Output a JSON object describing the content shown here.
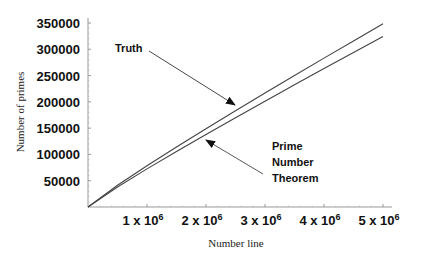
{
  "chart_data": {
    "type": "line",
    "title": "",
    "xlabel": "Number line",
    "ylabel": "Number of primes",
    "xlim": [
      0,
      5000000
    ],
    "ylim": [
      0,
      350000
    ],
    "x_ticks": [
      {
        "value": 1000000,
        "label": "1 x 10",
        "exp": "6"
      },
      {
        "value": 2000000,
        "label": "2 x 10",
        "exp": "6"
      },
      {
        "value": 3000000,
        "label": "3 x 10",
        "exp": "6"
      },
      {
        "value": 4000000,
        "label": "4 x 10",
        "exp": "6"
      },
      {
        "value": 5000000,
        "label": "5 x 10",
        "exp": "6"
      }
    ],
    "y_ticks": [
      {
        "value": 50000,
        "label": "50000"
      },
      {
        "value": 100000,
        "label": "100000"
      },
      {
        "value": 150000,
        "label": "150000"
      },
      {
        "value": 200000,
        "label": "200000"
      },
      {
        "value": 250000,
        "label": "250000"
      },
      {
        "value": 300000,
        "label": "300000"
      },
      {
        "value": 350000,
        "label": "350000"
      }
    ],
    "grid": false,
    "legend": "none (inline annotations)",
    "x": [
      0,
      500000,
      1000000,
      1500000,
      2000000,
      2500000,
      3000000,
      3500000,
      4000000,
      4500000,
      5000000
    ],
    "series": [
      {
        "name": "Truth",
        "values": [
          0,
          41538,
          78498,
          114155,
          148933,
          183072,
          216816,
          250150,
          283146,
          315948,
          348513
        ]
      },
      {
        "name": "Prime Number Theorem",
        "values": [
          0,
          38102,
          72382,
          105477,
          137849,
          169718,
          201211,
          232410,
          263369,
          294127,
          324150
        ]
      }
    ],
    "annotations": [
      {
        "text": "Truth",
        "points_to": "Truth"
      },
      {
        "text": "Prime Number Theorem",
        "lines": [
          "Prime",
          "Number",
          "Theorem"
        ],
        "points_to": "Prime Number Theorem"
      }
    ]
  }
}
